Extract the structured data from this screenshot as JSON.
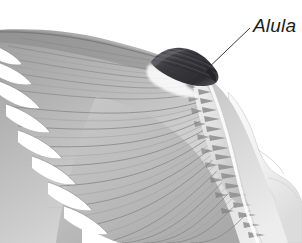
{
  "figure": {
    "background_color": "#ffffff",
    "width": 302,
    "height": 243,
    "rendering": "grayscale-photographic-illustration"
  },
  "annotations": {
    "alula": {
      "label": "Alula",
      "label_style": "italic",
      "label_color": "#1c1c1c",
      "label_x": 253,
      "label_y": 16,
      "leader_line": {
        "color": "#3c3c3c",
        "from_x": 250,
        "from_y": 28,
        "to_x": 203,
        "to_y": 73
      }
    }
  },
  "structures": {
    "alula_patch": {
      "name": "alula-feather-tuft",
      "color_dark": "#35353a",
      "color_mid": "#5e5e63",
      "x": 150,
      "y": 48,
      "width": 72,
      "height": 42
    },
    "primaries": {
      "name": "primary-feathers",
      "count": 10,
      "color_light": "#d9d9d9",
      "color_mid": "#a8a8a8",
      "color_dark": "#7c7c7c"
    },
    "secondaries": {
      "name": "secondary-feathers",
      "count": 12,
      "color_light": "#e2e2e2",
      "color_mid": "#b2b2b2"
    },
    "greater_coverts": {
      "name": "greater-covert-row",
      "count": 20,
      "color_mid": "#9a9a9a"
    },
    "wing_base": {
      "name": "wing-base-body-attachment",
      "color_light": "#ececec",
      "color_outline": "#c4c4c4"
    }
  },
  "palette": {
    "background": "#ffffff",
    "feather_lightest": "#efefef",
    "feather_light": "#d4d4d4",
    "feather_mid": "#a9a9a9",
    "feather_dark": "#7a7a7a",
    "feather_darkest": "#4a4a4a",
    "alula_black": "#2f2f34",
    "label_ink": "#1c1c1c",
    "leader_line": "#3c3c3c"
  }
}
